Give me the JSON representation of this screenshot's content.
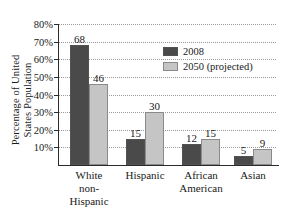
{
  "chart_data": {
    "type": "bar",
    "title": "",
    "subtitle": "",
    "xlabel": "",
    "ylabel": "Percentage of United States Population",
    "ylabel_lines": [
      "Percentage of United United",
      "States Population"
    ],
    "categories": [
      "White non-Hispanic",
      "Hispanic",
      "African American",
      "Asian"
    ],
    "category_lines": [
      [
        "White",
        "non-",
        "Hispanic"
      ],
      [
        "Hispanic"
      ],
      [
        "African",
        "American"
      ],
      [
        "Asian"
      ]
    ],
    "series": [
      {
        "name": "2008",
        "values": [
          68,
          15,
          12,
          5
        ],
        "color": "#4a4a4a"
      },
      {
        "name": "2050 (projected)",
        "values": [
          46,
          30,
          15,
          9
        ],
        "color": "#c5c5c5"
      }
    ],
    "ylim": [
      0,
      80
    ],
    "ytick_values": [
      10,
      20,
      30,
      40,
      50,
      60,
      70,
      80
    ],
    "ytick_labels": [
      "10%",
      "20%",
      "30%",
      "40%",
      "50%",
      "60%",
      "70%",
      "80%"
    ],
    "grid": true,
    "grid_style": "dotted",
    "legend_position": "upper-right"
  },
  "axis": {
    "y_title_line1": "Percentage of United",
    "y_title_line2": "States Population",
    "ticks": [
      {
        "label": "80%",
        "value": 80
      },
      {
        "label": "70%",
        "value": 70
      },
      {
        "label": "60%",
        "value": 60
      },
      {
        "label": "50%",
        "value": 50
      },
      {
        "label": "40%",
        "value": 40
      },
      {
        "label": "30%",
        "value": 30
      },
      {
        "label": "20%",
        "value": 20
      },
      {
        "label": "10%",
        "value": 10
      }
    ]
  },
  "legend": {
    "items": [
      {
        "label": "2008",
        "color": "#4a4a4a"
      },
      {
        "label": "2050 (projected)",
        "color": "#c5c5c5"
      }
    ]
  },
  "groups": [
    {
      "name": "White non-Hispanic",
      "lines": [
        "White",
        "non-",
        "Hispanic"
      ],
      "bars": [
        {
          "series": "2008",
          "value": 68,
          "label": "68"
        },
        {
          "series": "2050 (projected)",
          "value": 46,
          "label": "46"
        }
      ]
    },
    {
      "name": "Hispanic",
      "lines": [
        "Hispanic"
      ],
      "bars": [
        {
          "series": "2008",
          "value": 15,
          "label": "15"
        },
        {
          "series": "2050 (projected)",
          "value": 30,
          "label": "30"
        }
      ]
    },
    {
      "name": "African American",
      "lines": [
        "African",
        "American"
      ],
      "bars": [
        {
          "series": "2008",
          "value": 12,
          "label": "12"
        },
        {
          "series": "2050 (projected)",
          "value": 15,
          "label": "15"
        }
      ]
    },
    {
      "name": "Asian",
      "lines": [
        "Asian"
      ],
      "bars": [
        {
          "series": "2008",
          "value": 5,
          "label": "5"
        },
        {
          "series": "2050 (projected)",
          "value": 9,
          "label": "9"
        }
      ]
    }
  ],
  "colors": {
    "series_2008": "#4a4a4a",
    "series_2050": "#c5c5c5",
    "axis": "#2a2a2a",
    "grid": "#9a9a9a",
    "background": "#ffffff",
    "text": "#1a1a1a"
  }
}
